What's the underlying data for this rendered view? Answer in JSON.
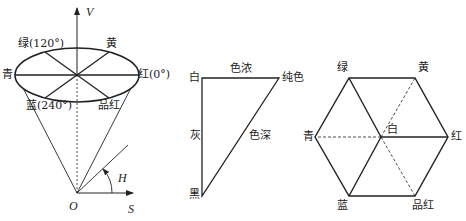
{
  "hsv_cone": {
    "axis_v": "V",
    "axis_s": "S",
    "angle_h": "H",
    "origin": "O",
    "labels": {
      "green": "绿(120°)",
      "yellow": "黄",
      "cyan": "青",
      "red": "红(0°)",
      "blue": "蓝(240°)",
      "magenta": "品红"
    }
  },
  "triangle": {
    "white": "白",
    "pure": "纯色",
    "black": "黑",
    "top_edge": "色浓",
    "left_edge": "灰",
    "hypotenuse": "色深"
  },
  "hexagon": {
    "green": "绿",
    "yellow": "黄",
    "cyan": "青",
    "white": "白",
    "red": "红",
    "blue": "蓝",
    "magenta": "品红"
  },
  "colors": {
    "stroke": "#222222",
    "background": "#ffffff"
  }
}
